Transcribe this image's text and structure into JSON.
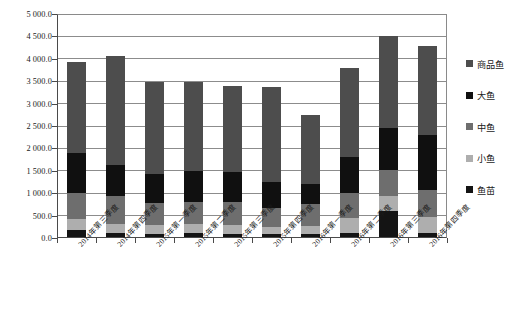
{
  "chart_data": {
    "type": "bar",
    "stacked": true,
    "title": "",
    "xlabel": "",
    "ylabel": "",
    "ylim": [
      0,
      5000
    ],
    "ytick_step": 500,
    "grid": true,
    "legend_position": "right",
    "categories": [
      "2014年第三季度",
      "2014年第四季度",
      "2015年第一季度",
      "2015年第二季度",
      "2015年第三季度",
      "2015年第四季度",
      "2016年第一季度",
      "2016年第二季度",
      "2016年第三季度",
      "2016年第四季度"
    ],
    "ytick_labels": [
      "0.0",
      "500.0",
      "1 000.0",
      "1 500.0",
      "2 000.0",
      "2 500.0",
      "3 000.0",
      "3 500.0",
      "4 000.0",
      "4 500.0",
      "5 000.0"
    ],
    "ytick_values": [
      0,
      500,
      1000,
      1500,
      2000,
      2500,
      3000,
      3500,
      4000,
      4500,
      5000
    ],
    "series": [
      {
        "name": "鱼苗",
        "color": "#141414",
        "values": [
          190,
          120,
          100,
          110,
          95,
          100,
          95,
          120,
          600,
          120
        ]
      },
      {
        "name": "小鱼",
        "color": "#aeaeae",
        "values": [
          240,
          200,
          190,
          210,
          185,
          150,
          175,
          330,
          330,
          340
        ]
      },
      {
        "name": "中鱼",
        "color": "#6e6e6e",
        "values": [
          570,
          620,
          500,
          490,
          530,
          430,
          480,
          560,
          580,
          620
        ]
      },
      {
        "name": "大鱼",
        "color": "#101010",
        "values": [
          900,
          690,
          650,
          680,
          660,
          560,
          450,
          790,
          940,
          1220
        ]
      },
      {
        "name": "商品鱼",
        "color": "#4d4d4d",
        "values": [
          2020,
          2430,
          2040,
          2000,
          1930,
          2140,
          1540,
          2000,
          2050,
          1990
        ]
      }
    ],
    "totals": [
      3920,
      4060,
      3480,
      3490,
      3400,
      3380,
      2740,
      3800,
      4500,
      4290
    ],
    "legend": [
      {
        "label": "商品鱼",
        "color": "#4d4d4d"
      },
      {
        "label": "大鱼",
        "color": "#101010"
      },
      {
        "label": "中鱼",
        "color": "#6e6e6e"
      },
      {
        "label": "小鱼",
        "color": "#aeaeae"
      },
      {
        "label": "鱼苗",
        "color": "#141414"
      }
    ]
  }
}
